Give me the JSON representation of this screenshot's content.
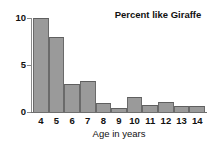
{
  "chart_data": {
    "type": "bar",
    "title": "Percent like Giraffe",
    "xlabel": "Age in years",
    "ylabel": "",
    "categories": [
      "4",
      "5",
      "6",
      "7",
      "8",
      "9",
      "10",
      "11",
      "12",
      "13",
      "14"
    ],
    "values": [
      10,
      8,
      3,
      3.3,
      1,
      0.4,
      1.6,
      0.7,
      1.1,
      0.6,
      0.6
    ],
    "ylim": [
      0,
      10
    ],
    "xlim_categories": [
      "4",
      "14"
    ],
    "yticks": [
      0,
      5,
      10
    ],
    "ytick_labels": [
      "0",
      "5",
      "10"
    ],
    "grid": false,
    "legend": false,
    "legend_position": "none",
    "bar_color": "#9a9a9a",
    "bar_edge_color": "#6a6a6a",
    "axis_color": "#8a8a8a",
    "text_color": "#111111",
    "background_color": "#ffffff"
  }
}
